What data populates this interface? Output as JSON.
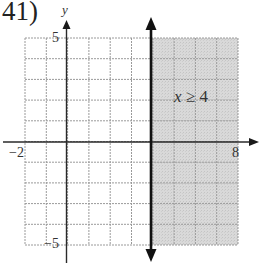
{
  "problem": {
    "number_label": "41)"
  },
  "chart_data": {
    "type": "inequality-graph",
    "title": "",
    "inequality": "x ≥ 4",
    "inequality_label": {
      "var": "x",
      "op": "≥",
      "value": "4"
    },
    "boundary": {
      "kind": "vertical",
      "x": 4,
      "style": "solid",
      "arrows": "both"
    },
    "shaded_region": {
      "x_from": 4,
      "x_to": 8,
      "y_from": -5,
      "y_to": 5,
      "color": "#d6d6d6"
    },
    "xlim": [
      -2,
      8
    ],
    "ylim": [
      -5,
      5
    ],
    "grid": true,
    "grid_step": 1,
    "xlabel": "",
    "ylabel": "y",
    "tick_labels": {
      "x_min": "−2",
      "x_max": "8",
      "y_max": "5",
      "y_min": "−5"
    },
    "colors": {
      "grid": "#9a9a9a",
      "axis": "#2a2a2a",
      "boundary": "#111111",
      "shade": "#d6d6d6"
    }
  }
}
